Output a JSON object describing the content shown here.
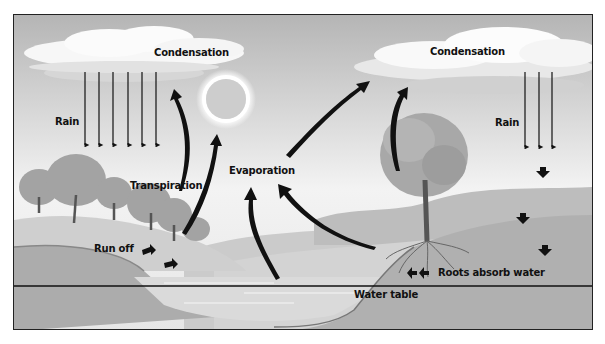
{
  "diagram": {
    "labels": {
      "condensation_left": "Condensation",
      "condensation_right": "Condensation",
      "rain_left": "Rain",
      "rain_right": "Rain",
      "transpiration": "Transpiration",
      "evaporation": "Evaporation",
      "run_off": "Run off",
      "roots_absorb_water": "Roots absorb water",
      "water_table": "Water table"
    },
    "colors": {
      "sky_top": "#b9b9b9",
      "sky_bottom": "#f2f2f2",
      "cloud": "#f7f7f7",
      "ground": "#a9a9a9",
      "hill": "#c4c4c4",
      "water": "#d8d8d8",
      "tree": "#9a9a9a",
      "arrow": "#111111",
      "border": "#222222"
    }
  }
}
